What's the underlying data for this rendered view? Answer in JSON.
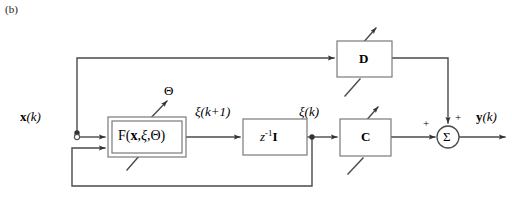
{
  "figure": {
    "caption": "(b)",
    "type": "block-diagram"
  },
  "colors": {
    "line": "#444444",
    "block_border": "#777777",
    "text": "#000000",
    "background": "#ffffff"
  },
  "blocks": [
    {
      "id": "f-block",
      "label": "F(x,ξ,Θ)",
      "label_parts": {
        "name": "F",
        "open": "(",
        "arg1": "x",
        "comma1": ",",
        "arg2": "ξ",
        "comma2": ",",
        "arg3": "Θ",
        "close": ")"
      },
      "style": "double-border",
      "adjustable": true,
      "x": 108,
      "y": 117,
      "w": 78,
      "h": 40
    },
    {
      "id": "delay-block",
      "label": "z⁻¹I",
      "label_parts": {
        "base": "z",
        "exp": "-1",
        "matrix": "I"
      },
      "style": "single-border",
      "adjustable": false,
      "x": 243,
      "y": 119,
      "w": 64,
      "h": 36
    },
    {
      "id": "c-block",
      "label": "C",
      "style": "single-border",
      "adjustable": true,
      "x": 340,
      "y": 119,
      "w": 51,
      "h": 37
    },
    {
      "id": "d-block",
      "label": "D",
      "style": "single-border",
      "adjustable": true,
      "x": 337,
      "y": 41,
      "w": 55,
      "h": 36
    }
  ],
  "nodes": [
    {
      "id": "sum-node",
      "label": "Σ",
      "shape": "circle",
      "cx": 448,
      "cy": 137,
      "r": 11
    },
    {
      "id": "input-terminal",
      "shape": "open-circle",
      "cx": 77,
      "cy": 137,
      "r": 2.5
    },
    {
      "id": "input-junction",
      "shape": "dot",
      "cx": 77,
      "cy": 130
    },
    {
      "id": "state-junction",
      "shape": "dot",
      "cx": 312,
      "cy": 137
    }
  ],
  "signals": [
    {
      "id": "input-signal",
      "label": "x(k)",
      "bold_part": "x",
      "paren": "(k)",
      "x": 20,
      "y": 117
    },
    {
      "id": "state-next-signal",
      "label": "ξ(k+1)",
      "x": 197,
      "y": 111
    },
    {
      "id": "state-signal",
      "label": "ξ(k)",
      "x": 300,
      "y": 111
    },
    {
      "id": "output-signal",
      "label": "y(k)",
      "bold_part": "y",
      "paren": "(k)",
      "x": 477,
      "y": 117
    },
    {
      "id": "parameter-signal",
      "label": "Θ",
      "x": 169,
      "y": 90
    }
  ],
  "sum_signs": [
    {
      "id": "sum-sign-left",
      "label": "+",
      "x": 425,
      "y": 124
    },
    {
      "id": "sum-sign-top",
      "label": "+",
      "x": 455,
      "y": 114
    }
  ],
  "connections": [
    {
      "from": "input-terminal",
      "to": "f-block",
      "type": "arrow"
    },
    {
      "from": "input-junction",
      "to": "d-block",
      "type": "arrow",
      "route": "up-right"
    },
    {
      "from": "f-block",
      "to": "delay-block",
      "type": "arrow"
    },
    {
      "from": "delay-block",
      "to": "c-block",
      "type": "arrow"
    },
    {
      "from": "state-junction",
      "to": "f-block",
      "type": "arrow",
      "route": "down-left-up-feedback"
    },
    {
      "from": "c-block",
      "to": "sum-node",
      "type": "arrow"
    },
    {
      "from": "d-block",
      "to": "sum-node",
      "type": "arrow",
      "route": "right-down"
    },
    {
      "from": "sum-node",
      "to": "output-signal",
      "type": "arrow"
    },
    {
      "from": "parameter-signal",
      "to": "f-block",
      "type": "arrow"
    }
  ]
}
